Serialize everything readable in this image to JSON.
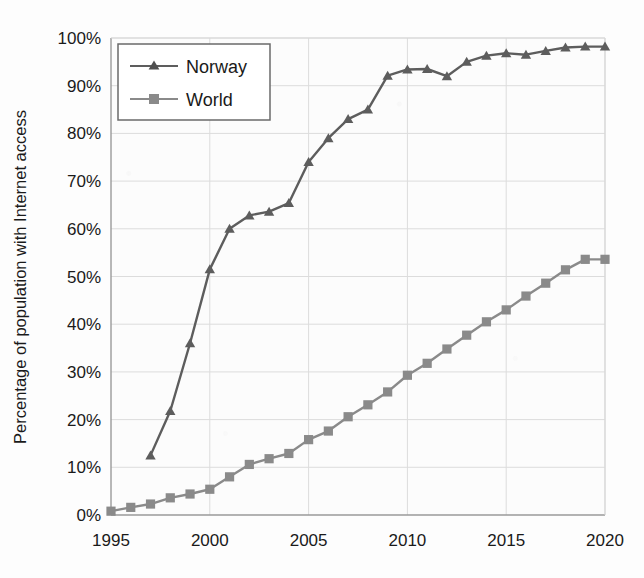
{
  "chart_data": {
    "type": "line",
    "title": "",
    "xlabel": "",
    "ylabel": "Percentage of population with Internet access",
    "xlim": [
      1995,
      2020
    ],
    "ylim": [
      0,
      100
    ],
    "grid": true,
    "legend_position": "top-left",
    "x_tick_labels": [
      "1995",
      "2000",
      "2005",
      "2010",
      "2015",
      "2020"
    ],
    "x_ticks": [
      1995,
      2000,
      2005,
      2010,
      2015,
      2020
    ],
    "y_tick_labels": [
      "0%",
      "10%",
      "20%",
      "30%",
      "40%",
      "50%",
      "60%",
      "70%",
      "80%",
      "90%",
      "100%"
    ],
    "y_ticks": [
      0,
      10,
      20,
      30,
      40,
      50,
      60,
      70,
      80,
      90,
      100
    ],
    "series": [
      {
        "name": "Norway",
        "marker": "triangle",
        "color": "#5d5d5d",
        "x": [
          1997,
          1998,
          1999,
          2000,
          2001,
          2002,
          2003,
          2004,
          2005,
          2006,
          2007,
          2008,
          2009,
          2010,
          2011,
          2012,
          2013,
          2014,
          2015,
          2016,
          2017,
          2018,
          2019,
          2020
        ],
        "values": [
          12.5,
          21.8,
          36.0,
          51.5,
          60.0,
          62.8,
          63.6,
          65.4,
          74.0,
          79.0,
          83.0,
          85.0,
          92.1,
          93.4,
          93.5,
          92.0,
          95.0,
          96.3,
          96.8,
          96.5,
          97.3,
          98.0,
          98.2,
          98.2
        ]
      },
      {
        "name": "World",
        "marker": "square",
        "color": "#8a8a8a",
        "x": [
          1995,
          1996,
          1997,
          1998,
          1999,
          2000,
          2001,
          2002,
          2003,
          2004,
          2005,
          2006,
          2007,
          2008,
          2009,
          2010,
          2011,
          2012,
          2013,
          2014,
          2015,
          2016,
          2017,
          2018,
          2019,
          2020
        ],
        "values": [
          0.8,
          1.6,
          2.3,
          3.6,
          4.4,
          5.4,
          8.0,
          10.6,
          11.8,
          12.9,
          15.8,
          17.6,
          20.6,
          23.1,
          25.8,
          29.3,
          31.8,
          34.8,
          37.7,
          40.5,
          43.0,
          45.9,
          48.6,
          51.4,
          53.6,
          53.6
        ]
      }
    ]
  },
  "legend": {
    "entries": [
      {
        "label": "Norway",
        "marker": "triangle-marker",
        "color": "#5d5d5d"
      },
      {
        "label": "World",
        "marker": "square-marker",
        "color": "#8a8a8a"
      }
    ]
  },
  "colors": {
    "norway": "#5d5d5d",
    "world": "#8a8a8a",
    "axis": "#9a9a9a",
    "grid": "#dcdcdc",
    "text": "#1a1a1a",
    "background": "#fdfdfd"
  }
}
